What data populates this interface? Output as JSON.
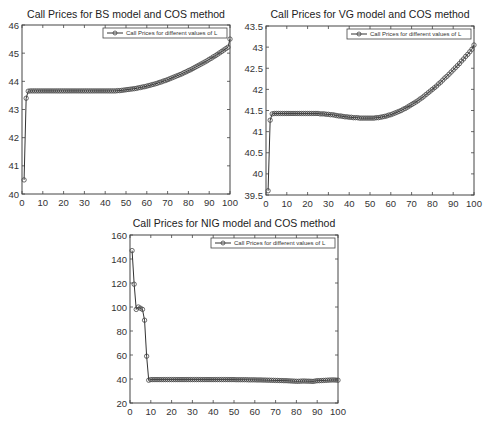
{
  "chart_data": [
    {
      "type": "line",
      "title": "Call Prices for BS model and COS method",
      "xlabel": "",
      "ylabel": "",
      "xlim": [
        0,
        100
      ],
      "ylim": [
        40,
        46
      ],
      "xticks": [
        0,
        10,
        20,
        30,
        40,
        50,
        60,
        70,
        80,
        90,
        100
      ],
      "yticks": [
        40,
        41,
        42,
        43,
        44,
        45,
        46
      ],
      "grid": false,
      "legend_position": "top-right",
      "series": [
        {
          "name": "Call Prices for different values of L",
          "marker": "circle",
          "x": [
            1,
            2,
            3,
            4,
            5,
            6,
            7,
            8,
            9,
            10,
            11,
            12,
            13,
            14,
            15,
            16,
            17,
            18,
            19,
            20,
            21,
            22,
            23,
            24,
            25,
            26,
            27,
            28,
            29,
            30,
            31,
            32,
            33,
            34,
            35,
            36,
            37,
            38,
            39,
            40,
            41,
            42,
            43,
            44,
            45,
            46,
            47,
            48,
            49,
            50,
            51,
            52,
            53,
            54,
            55,
            56,
            57,
            58,
            59,
            60,
            61,
            62,
            63,
            64,
            65,
            66,
            67,
            68,
            69,
            70,
            71,
            72,
            73,
            74,
            75,
            76,
            77,
            78,
            79,
            80,
            81,
            82,
            83,
            84,
            85,
            86,
            87,
            88,
            89,
            90,
            91,
            92,
            93,
            94,
            95,
            96,
            97,
            98,
            99,
            100
          ],
          "values": [
            40.5,
            43.4,
            43.65,
            43.66,
            43.66,
            43.66,
            43.66,
            43.66,
            43.66,
            43.66,
            43.66,
            43.66,
            43.66,
            43.66,
            43.66,
            43.66,
            43.66,
            43.66,
            43.66,
            43.66,
            43.66,
            43.66,
            43.66,
            43.66,
            43.66,
            43.66,
            43.66,
            43.66,
            43.66,
            43.66,
            43.66,
            43.66,
            43.66,
            43.66,
            43.66,
            43.66,
            43.66,
            43.66,
            43.66,
            43.66,
            43.66,
            43.66,
            43.66,
            43.66,
            43.66,
            43.67,
            43.67,
            43.68,
            43.69,
            43.7,
            43.71,
            43.72,
            43.73,
            43.74,
            43.75,
            43.77,
            43.78,
            43.8,
            43.81,
            43.83,
            43.85,
            43.87,
            43.89,
            43.91,
            43.93,
            43.96,
            43.98,
            44.01,
            44.03,
            44.06,
            44.09,
            44.12,
            44.15,
            44.18,
            44.21,
            44.24,
            44.27,
            44.31,
            44.34,
            44.38,
            44.41,
            44.45,
            44.49,
            44.53,
            44.57,
            44.61,
            44.65,
            44.69,
            44.73,
            44.78,
            44.82,
            44.87,
            44.91,
            44.96,
            45.01,
            45.06,
            45.11,
            45.16,
            45.21,
            45.5
          ]
        }
      ]
    },
    {
      "type": "line",
      "title": "Call Prices for VG model and COS method",
      "xlabel": "",
      "ylabel": "",
      "xlim": [
        0,
        100
      ],
      "ylim": [
        39.5,
        43.5
      ],
      "xticks": [
        0,
        10,
        20,
        30,
        40,
        50,
        60,
        70,
        80,
        90,
        100
      ],
      "yticks": [
        39.5,
        40,
        40.5,
        41,
        41.5,
        42,
        42.5,
        43,
        43.5
      ],
      "grid": false,
      "legend_position": "top-right",
      "series": [
        {
          "name": "Call Prices for different values of L",
          "marker": "circle",
          "x": [
            1,
            2,
            3,
            4,
            5,
            6,
            7,
            8,
            9,
            10,
            11,
            12,
            13,
            14,
            15,
            16,
            17,
            18,
            19,
            20,
            21,
            22,
            23,
            24,
            25,
            26,
            27,
            28,
            29,
            30,
            31,
            32,
            33,
            34,
            35,
            36,
            37,
            38,
            39,
            40,
            41,
            42,
            43,
            44,
            45,
            46,
            47,
            48,
            49,
            50,
            51,
            52,
            53,
            54,
            55,
            56,
            57,
            58,
            59,
            60,
            61,
            62,
            63,
            64,
            65,
            66,
            67,
            68,
            69,
            70,
            71,
            72,
            73,
            74,
            75,
            76,
            77,
            78,
            79,
            80,
            81,
            82,
            83,
            84,
            85,
            86,
            87,
            88,
            89,
            90,
            91,
            92,
            93,
            94,
            95,
            96,
            97,
            98,
            99,
            100
          ],
          "values": [
            39.6,
            41.27,
            41.42,
            41.43,
            41.43,
            41.43,
            41.43,
            41.43,
            41.43,
            41.43,
            41.43,
            41.43,
            41.43,
            41.43,
            41.43,
            41.43,
            41.43,
            41.43,
            41.43,
            41.43,
            41.43,
            41.43,
            41.43,
            41.43,
            41.43,
            41.42,
            41.42,
            41.42,
            41.41,
            41.41,
            41.4,
            41.4,
            41.39,
            41.38,
            41.37,
            41.37,
            41.36,
            41.35,
            41.35,
            41.34,
            41.34,
            41.33,
            41.33,
            41.33,
            41.32,
            41.32,
            41.32,
            41.32,
            41.32,
            41.32,
            41.32,
            41.32,
            41.33,
            41.33,
            41.34,
            41.35,
            41.36,
            41.37,
            41.39,
            41.4,
            41.42,
            41.44,
            41.46,
            41.48,
            41.5,
            41.53,
            41.55,
            41.58,
            41.61,
            41.64,
            41.67,
            41.7,
            41.73,
            41.77,
            41.8,
            41.84,
            41.88,
            41.92,
            41.96,
            42.0,
            42.04,
            42.08,
            42.13,
            42.17,
            42.22,
            42.27,
            42.31,
            42.36,
            42.41,
            42.46,
            42.51,
            42.56,
            42.61,
            42.67,
            42.72,
            42.78,
            42.83,
            42.89,
            42.95,
            43.05
          ]
        }
      ]
    },
    {
      "type": "line",
      "title": "Call Prices for NIG model and COS method",
      "xlabel": "",
      "ylabel": "",
      "xlim": [
        0,
        100
      ],
      "ylim": [
        20,
        160
      ],
      "xticks": [
        0,
        10,
        20,
        30,
        40,
        50,
        60,
        70,
        80,
        90,
        100
      ],
      "yticks": [
        20,
        40,
        60,
        80,
        100,
        120,
        140,
        160
      ],
      "grid": false,
      "legend_position": "top-right",
      "series": [
        {
          "name": "Call Prices for different values of L",
          "marker": "circle",
          "x": [
            1,
            2,
            3,
            4,
            5,
            6,
            7,
            8,
            9,
            10,
            11,
            12,
            13,
            14,
            15,
            16,
            17,
            18,
            19,
            20,
            21,
            22,
            23,
            24,
            25,
            26,
            27,
            28,
            29,
            30,
            31,
            32,
            33,
            34,
            35,
            36,
            37,
            38,
            39,
            40,
            41,
            42,
            43,
            44,
            45,
            46,
            47,
            48,
            49,
            50,
            51,
            52,
            53,
            54,
            55,
            56,
            57,
            58,
            59,
            60,
            61,
            62,
            63,
            64,
            65,
            66,
            67,
            68,
            69,
            70,
            71,
            72,
            73,
            74,
            75,
            76,
            77,
            78,
            79,
            80,
            81,
            82,
            83,
            84,
            85,
            86,
            87,
            88,
            89,
            90,
            91,
            92,
            93,
            94,
            95,
            96,
            97,
            98,
            99,
            100
          ],
          "values": [
            147,
            119,
            98,
            100,
            99,
            98,
            89,
            59,
            39,
            39.5,
            39.5,
            39.5,
            39.5,
            39.5,
            39.5,
            39.5,
            39.5,
            39.5,
            39.5,
            39.5,
            39.5,
            39.5,
            39.5,
            39.5,
            39.5,
            39.5,
            39.5,
            39.5,
            39.5,
            39.5,
            39.5,
            39.5,
            39.5,
            39.5,
            39.5,
            39.5,
            39.5,
            39.5,
            39.5,
            39.5,
            39.5,
            39.5,
            39.5,
            39.5,
            39.5,
            39.5,
            39.5,
            39.5,
            39.5,
            39.5,
            39.4,
            39.4,
            39.4,
            39.4,
            39.4,
            39.4,
            39.3,
            39.3,
            39.3,
            39.3,
            39.2,
            39.2,
            39.2,
            39.1,
            39.1,
            39.0,
            39.0,
            38.9,
            38.9,
            38.8,
            38.8,
            38.7,
            38.7,
            38.6,
            38.6,
            38.5,
            38.4,
            38.3,
            38.2,
            38.1,
            38.1,
            38.2,
            38.3,
            38.3,
            38.2,
            38.2,
            38.1,
            38.0,
            38.3,
            38.6,
            38.6,
            38.7,
            38.8,
            38.9,
            39.0,
            39.1,
            39.2,
            39.2,
            39.1,
            39.0
          ]
        }
      ]
    }
  ]
}
